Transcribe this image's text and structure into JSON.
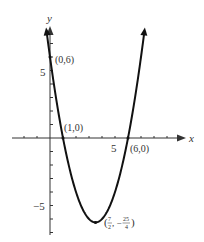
{
  "chart_data": {
    "type": "line",
    "title": "",
    "function": "y = x^2 - 7x + 6",
    "xlabel": "x",
    "ylabel": "y",
    "xlim": [
      -2,
      9
    ],
    "ylim": [
      -7,
      9
    ],
    "x_tick_labels": [
      {
        "value": 5,
        "label": "5"
      }
    ],
    "y_tick_labels": [
      {
        "value": 5,
        "label": "5"
      },
      {
        "value": -5,
        "label": "−5"
      }
    ],
    "annotations": [
      {
        "point": [
          0,
          6
        ],
        "label": "(0,6)"
      },
      {
        "point": [
          1,
          0
        ],
        "label": "(1,0)"
      },
      {
        "point": [
          6,
          0
        ],
        "label": "(6,0)"
      },
      {
        "point": [
          3.5,
          -6.25
        ],
        "label": "(7/2, −25/4)"
      }
    ],
    "grid": false
  },
  "labels": {
    "x_axis": "x",
    "y_axis": "y",
    "tick_x5": "5",
    "tick_y5": "5",
    "tick_yneg5": "−5",
    "pt_0_6": "(0,6)",
    "pt_1_0": "(1,0)",
    "pt_6_0": "(6,0)",
    "vertex_num_x": "7",
    "vertex_den_x": "2",
    "vertex_num_y": "25",
    "vertex_den_y": "4"
  },
  "colors": {
    "curve": "#111111",
    "axis": "#333333"
  }
}
